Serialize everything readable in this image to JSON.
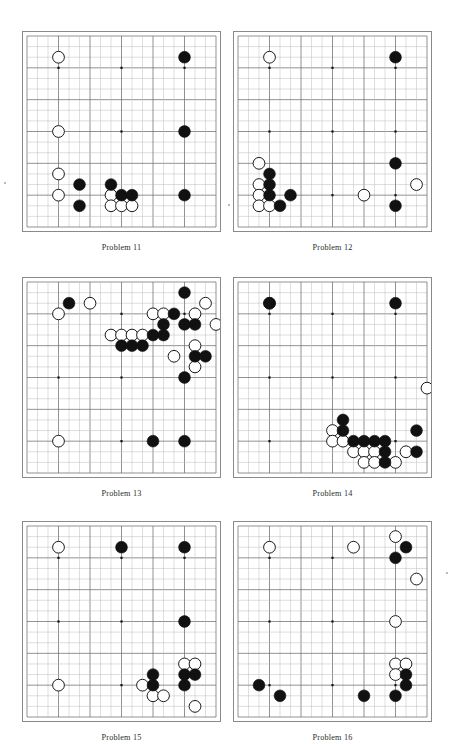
{
  "page": {
    "board_size": 19,
    "colors": {
      "grid_line": "#6e6e6e",
      "grid_line_light": "#bdbdbd",
      "border": "#8a8a8a",
      "black_stone": "#111111",
      "white_stone": "#ffffff",
      "white_stone_outline": "#1a1a1a",
      "star_point": "#111111",
      "label_text": "#2b2b2b",
      "background": "#ffffff"
    },
    "star_points": [
      [
        3,
        3
      ],
      [
        9,
        3
      ],
      [
        15,
        3
      ],
      [
        3,
        9
      ],
      [
        9,
        9
      ],
      [
        15,
        9
      ],
      [
        3,
        15
      ],
      [
        9,
        15
      ],
      [
        15,
        15
      ]
    ]
  },
  "boards": [
    {
      "id": "board-problem-11",
      "label": "Problem 11",
      "black": [
        [
          15,
          2
        ],
        [
          15,
          9
        ],
        [
          15,
          15
        ],
        [
          5,
          14
        ],
        [
          8,
          14
        ],
        [
          9,
          15
        ],
        [
          10,
          15
        ],
        [
          5,
          16
        ]
      ],
      "white": [
        [
          3,
          2
        ],
        [
          3,
          9
        ],
        [
          3,
          13
        ],
        [
          3,
          15
        ],
        [
          8,
          15
        ],
        [
          8,
          16
        ],
        [
          9,
          16
        ],
        [
          10,
          16
        ]
      ]
    },
    {
      "id": "board-problem-12",
      "label": "Problem 12",
      "black": [
        [
          15,
          2
        ],
        [
          15,
          12
        ],
        [
          15,
          16
        ],
        [
          3,
          13
        ],
        [
          3,
          14
        ],
        [
          3,
          15
        ],
        [
          5,
          15
        ],
        [
          4,
          16
        ]
      ],
      "white": [
        [
          3,
          2
        ],
        [
          2,
          12
        ],
        [
          2,
          14
        ],
        [
          2,
          15
        ],
        [
          2,
          16
        ],
        [
          3,
          16
        ],
        [
          12,
          15
        ],
        [
          17,
          14
        ]
      ]
    },
    {
      "id": "board-problem-13",
      "label": "Problem 13",
      "black": [
        [
          4,
          2
        ],
        [
          15,
          1
        ],
        [
          14,
          3
        ],
        [
          13,
          4
        ],
        [
          15,
          4
        ],
        [
          16,
          4
        ],
        [
          12,
          5
        ],
        [
          13,
          5
        ],
        [
          9,
          6
        ],
        [
          10,
          6
        ],
        [
          11,
          6
        ],
        [
          16,
          7
        ],
        [
          17,
          7
        ],
        [
          15,
          9
        ],
        [
          12,
          15
        ],
        [
          15,
          15
        ]
      ],
      "white": [
        [
          3,
          3
        ],
        [
          6,
          2
        ],
        [
          12,
          3
        ],
        [
          13,
          3
        ],
        [
          16,
          3
        ],
        [
          17,
          2
        ],
        [
          18,
          4
        ],
        [
          8,
          5
        ],
        [
          9,
          5
        ],
        [
          10,
          5
        ],
        [
          11,
          5
        ],
        [
          16,
          6
        ],
        [
          16,
          8
        ],
        [
          14,
          7
        ],
        [
          3,
          15
        ]
      ]
    },
    {
      "id": "board-problem-14",
      "label": "Problem 14",
      "black": [
        [
          3,
          2
        ],
        [
          15,
          2
        ],
        [
          10,
          13
        ],
        [
          10,
          14
        ],
        [
          11,
          15
        ],
        [
          12,
          15
        ],
        [
          13,
          15
        ],
        [
          14,
          15
        ],
        [
          17,
          14
        ],
        [
          14,
          16
        ],
        [
          17,
          16
        ],
        [
          14,
          17
        ]
      ],
      "white": [
        [
          3,
          2
        ],
        [
          18,
          10
        ],
        [
          9,
          14
        ],
        [
          9,
          15
        ],
        [
          10,
          15
        ],
        [
          11,
          16
        ],
        [
          12,
          16
        ],
        [
          13,
          16
        ],
        [
          16,
          16
        ],
        [
          12,
          17
        ],
        [
          13,
          17
        ],
        [
          15,
          17
        ]
      ]
    },
    {
      "id": "board-problem-15",
      "label": "Problem 15",
      "black": [
        [
          9,
          2
        ],
        [
          15,
          2
        ],
        [
          15,
          9
        ],
        [
          12,
          14
        ],
        [
          15,
          14
        ],
        [
          16,
          14
        ],
        [
          12,
          15
        ],
        [
          15,
          15
        ]
      ],
      "white": [
        [
          3,
          2
        ],
        [
          3,
          15
        ],
        [
          15,
          13
        ],
        [
          16,
          13
        ],
        [
          11,
          15
        ],
        [
          12,
          16
        ],
        [
          13,
          16
        ],
        [
          16,
          17
        ]
      ]
    },
    {
      "id": "board-problem-16",
      "label": "Problem 16",
      "black": [
        [
          16,
          2
        ],
        [
          15,
          3
        ],
        [
          2,
          15
        ],
        [
          4,
          16
        ],
        [
          12,
          16
        ],
        [
          15,
          16
        ],
        [
          16,
          14
        ],
        [
          16,
          15
        ]
      ],
      "white": [
        [
          3,
          2
        ],
        [
          11,
          2
        ],
        [
          15,
          1
        ],
        [
          17,
          5
        ],
        [
          15,
          9
        ],
        [
          15,
          13
        ],
        [
          16,
          13
        ],
        [
          15,
          14
        ]
      ]
    }
  ]
}
